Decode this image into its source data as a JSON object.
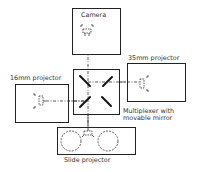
{
  "diagram": {
    "type": "optical-layout",
    "colors": {
      "line": "#222222",
      "text": "#333333",
      "background": "#ffffff"
    },
    "nodes": [
      {
        "id": "camera",
        "label": "Camera"
      },
      {
        "id": "projector_35mm",
        "label": "35mm projector"
      },
      {
        "id": "projector_16mm",
        "label": "16mm projector"
      },
      {
        "id": "multiplexer",
        "label_line1": "Multiplexer with",
        "label_line2": "movable mirror"
      },
      {
        "id": "slide_projector",
        "label": "Slide projector"
      }
    ],
    "edges": [
      {
        "from": "camera",
        "to": "multiplexer",
        "style": "dash-dot"
      },
      {
        "from": "projector_35mm",
        "to": "multiplexer",
        "style": "dash-dot"
      },
      {
        "from": "projector_16mm",
        "to": "multiplexer",
        "style": "dash-dot"
      },
      {
        "from": "slide_projector",
        "to": "multiplexer",
        "style": "dash-dot"
      }
    ]
  }
}
